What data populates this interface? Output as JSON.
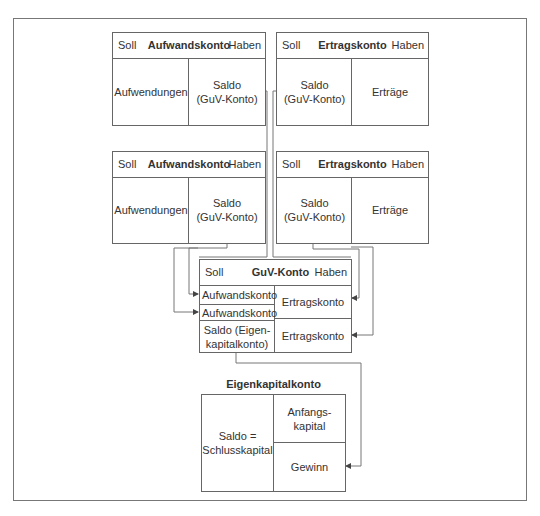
{
  "accounts": {
    "top_left": {
      "soll": "Soll",
      "title": "Aufwandskonto",
      "haben": "Haben",
      "left": "Aufwendungen",
      "right_line1": "Saldo",
      "right_line2": "(GuV-Konto)"
    },
    "top_right": {
      "soll": "Soll",
      "title": "Ertragskonto",
      "haben": "Haben",
      "left_line1": "Saldo",
      "left_line2": "(GuV-Konto)",
      "right": "Erträge"
    },
    "mid_left": {
      "soll": "Soll",
      "title": "Aufwandskonto",
      "haben": "Haben",
      "left": "Aufwendungen",
      "right_line1": "Saldo",
      "right_line2": "(GuV-Konto)"
    },
    "mid_right": {
      "soll": "Soll",
      "title": "Ertragskonto",
      "haben": "Haben",
      "left_line1": "Saldo",
      "left_line2": "(GuV-Konto)",
      "right": "Erträge"
    },
    "guv": {
      "soll": "Soll",
      "title": "GuV-Konto",
      "haben": "Haben",
      "left_rows": [
        "Aufwandskonto",
        "Aufwandskonto"
      ],
      "saldo_line1": "Saldo (Eigen-",
      "saldo_line2": "kapitalkonto)",
      "right_rows": [
        "Ertragskonto",
        "Ertragskonto"
      ]
    },
    "eigenkapital": {
      "title": "Eigenkapitalkonto",
      "left_line1": "Saldo =",
      "left_line2": "Schlusskapital",
      "right_top_line1": "Anfangs-",
      "right_top_line2": "kapital",
      "right_bottom": "Gewinn"
    }
  },
  "colors": {
    "line": "#666666",
    "frame": "#777777",
    "text": "#333333"
  }
}
